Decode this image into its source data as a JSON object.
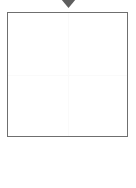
{
  "canvas": {
    "width": 136,
    "height": 188,
    "background_color": "#ffffff"
  },
  "marker": {
    "icon": "caret-down-icon",
    "color": "#5e5e5e",
    "label": "",
    "x": 68,
    "y": 4
  },
  "panel": {
    "label": "",
    "border_color": "#6f6f6f",
    "fill_color": "#ffffff",
    "x": 7,
    "y": 12,
    "width": 121,
    "height": 125,
    "content": ""
  },
  "grid": {
    "color": "#fafafa",
    "vertical_x": 68,
    "horizontal_y": 75,
    "visible": true
  },
  "quadrants": [
    {
      "name": "top-left",
      "content": ""
    },
    {
      "name": "top-right",
      "content": ""
    },
    {
      "name": "bottom-left",
      "content": ""
    },
    {
      "name": "bottom-right",
      "content": ""
    }
  ],
  "below": {
    "content": ""
  }
}
